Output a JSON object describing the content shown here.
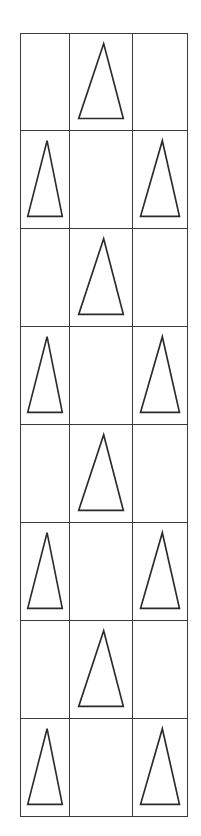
{
  "figure": {
    "canvas": {
      "width": 201,
      "height": 836,
      "background_color": "#ffffff"
    },
    "grid": {
      "rows": 8,
      "columns": 3,
      "left": 20,
      "top": 33,
      "width": 168,
      "height": 784,
      "row_height": 98,
      "column_widths": [
        50,
        63,
        55
      ],
      "line_color": "#3a3a3a",
      "line_width": 1.3
    },
    "shape_style": {
      "name": "triangle",
      "fill_color": "#ffffff",
      "stroke_color": "#2b2b2b",
      "stroke_width": 1.7,
      "orientation": "point-up",
      "apex_offset": "slightly right of base center"
    },
    "pattern_rule": "Odd-numbered rows place one triangle in the middle column; even-numbered rows place triangles in the left and right columns.",
    "cells": [
      {
        "row": 1,
        "col": 1,
        "name": "cell-r1c1",
        "content": "empty"
      },
      {
        "row": 1,
        "col": 2,
        "name": "cell-r1c2",
        "content": "triangle"
      },
      {
        "row": 1,
        "col": 3,
        "name": "cell-r1c3",
        "content": "empty"
      },
      {
        "row": 2,
        "col": 1,
        "name": "cell-r2c1",
        "content": "triangle"
      },
      {
        "row": 2,
        "col": 2,
        "name": "cell-r2c2",
        "content": "empty"
      },
      {
        "row": 2,
        "col": 3,
        "name": "cell-r2c3",
        "content": "triangle"
      },
      {
        "row": 3,
        "col": 1,
        "name": "cell-r3c1",
        "content": "empty"
      },
      {
        "row": 3,
        "col": 2,
        "name": "cell-r3c2",
        "content": "triangle"
      },
      {
        "row": 3,
        "col": 3,
        "name": "cell-r3c3",
        "content": "empty"
      },
      {
        "row": 4,
        "col": 1,
        "name": "cell-r4c1",
        "content": "triangle"
      },
      {
        "row": 4,
        "col": 2,
        "name": "cell-r4c2",
        "content": "empty"
      },
      {
        "row": 4,
        "col": 3,
        "name": "cell-r4c3",
        "content": "triangle"
      },
      {
        "row": 5,
        "col": 1,
        "name": "cell-r5c1",
        "content": "empty"
      },
      {
        "row": 5,
        "col": 2,
        "name": "cell-r5c2",
        "content": "triangle"
      },
      {
        "row": 5,
        "col": 3,
        "name": "cell-r5c3",
        "content": "empty"
      },
      {
        "row": 6,
        "col": 1,
        "name": "cell-r6c1",
        "content": "triangle"
      },
      {
        "row": 6,
        "col": 2,
        "name": "cell-r6c2",
        "content": "empty"
      },
      {
        "row": 6,
        "col": 3,
        "name": "cell-r6c3",
        "content": "triangle"
      },
      {
        "row": 7,
        "col": 1,
        "name": "cell-r7c1",
        "content": "empty"
      },
      {
        "row": 7,
        "col": 2,
        "name": "cell-r7c2",
        "content": "triangle"
      },
      {
        "row": 7,
        "col": 3,
        "name": "cell-r7c3",
        "content": "empty"
      },
      {
        "row": 8,
        "col": 1,
        "name": "cell-r8c1",
        "content": "triangle"
      },
      {
        "row": 8,
        "col": 2,
        "name": "cell-r8c2",
        "content": "empty"
      },
      {
        "row": 8,
        "col": 3,
        "name": "cell-r8c3",
        "content": "triangle"
      }
    ]
  }
}
